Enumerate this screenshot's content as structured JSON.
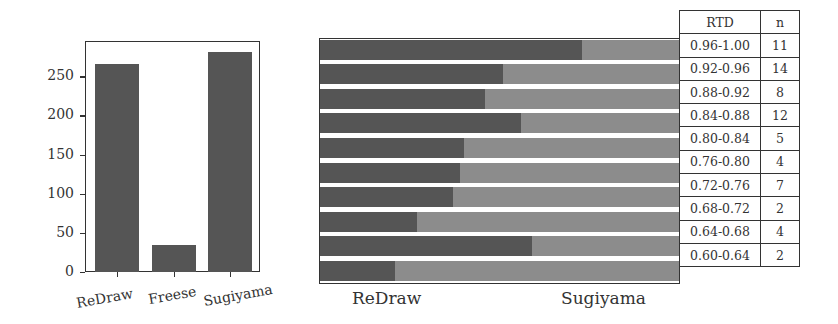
{
  "chart_data": [
    {
      "type": "bar",
      "title": "",
      "xlabel": "",
      "ylabel": "",
      "categories": [
        "ReDraw",
        "Freese",
        "Sugiyama"
      ],
      "values": [
        266,
        35,
        281
      ],
      "ylim": [
        0,
        295
      ],
      "yticks": [
        0,
        50,
        100,
        150,
        200,
        250
      ],
      "grid": false,
      "color": "#555555"
    },
    {
      "type": "bar",
      "orientation": "horizontal-stacked-100%",
      "title": "",
      "xlabel_left": "ReDraw",
      "xlabel_right": "Sugiyama",
      "categories": [
        "0.96-1.00",
        "0.92-0.96",
        "0.88-0.92",
        "0.84-0.88",
        "0.80-0.84",
        "0.76-0.80",
        "0.72-0.76",
        "0.68-0.72",
        "0.64-0.68",
        "0.60-0.64"
      ],
      "series": [
        {
          "name": "ReDraw",
          "color": "#555555",
          "values": [
            0.73,
            0.51,
            0.46,
            0.56,
            0.4,
            0.39,
            0.37,
            0.27,
            0.59,
            0.21
          ]
        },
        {
          "name": "Sugiyama",
          "color": "#8c8c8c",
          "values": [
            0.27,
            0.49,
            0.54,
            0.44,
            0.6,
            0.61,
            0.63,
            0.73,
            0.41,
            0.79
          ]
        }
      ],
      "grid": false
    },
    {
      "type": "table",
      "columns": [
        "RTD",
        "n"
      ],
      "rows": [
        [
          "0.96-1.00",
          "11"
        ],
        [
          "0.92-0.96",
          "14"
        ],
        [
          "0.88-0.92",
          "8"
        ],
        [
          "0.84-0.88",
          "12"
        ],
        [
          "0.80-0.84",
          "5"
        ],
        [
          "0.76-0.80",
          "4"
        ],
        [
          "0.72-0.76",
          "7"
        ],
        [
          "0.68-0.72",
          "2"
        ],
        [
          "0.64-0.68",
          "4"
        ],
        [
          "0.60-0.64",
          "2"
        ]
      ]
    }
  ],
  "left": {
    "yticks": [
      "0",
      "50",
      "100",
      "150",
      "200",
      "250"
    ],
    "categories": [
      "ReDraw",
      "Freese",
      "Sugiyama"
    ]
  },
  "right": {
    "label_left": "ReDraw",
    "label_right": "Sugiyama"
  },
  "table": {
    "header": [
      "RTD",
      "n"
    ]
  }
}
